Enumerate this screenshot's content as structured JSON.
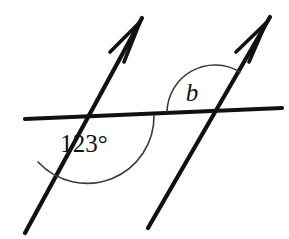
{
  "diagram": {
    "background_color": "#ffffff",
    "stroke_color": "#111111",
    "arc_color": "#3a3a3a",
    "canvas": {
      "width": 289,
      "height": 239
    },
    "labels": {
      "known_angle": "123°",
      "unknown_angle": "b"
    },
    "label_positions": {
      "known_angle": {
        "x": 84,
        "y": 152
      },
      "unknown_angle": {
        "x": 192,
        "y": 101
      }
    },
    "lines": [
      {
        "name": "transversal",
        "role": "horizontal-transversal",
        "x1": 25,
        "y1": 119,
        "x2": 282,
        "y2": 108,
        "arrowhead": false
      },
      {
        "name": "parallel-line-left",
        "role": "parallel-ray-left",
        "x1": 25,
        "y1": 233,
        "x2": 142,
        "y2": 18,
        "arrowhead": true
      },
      {
        "name": "parallel-line-right",
        "role": "parallel-ray-right",
        "x1": 148,
        "y1": 228,
        "x2": 270,
        "y2": 17,
        "arrowhead": true
      }
    ],
    "arrowheads": [
      {
        "name": "arrowhead-left",
        "tip_x": 140,
        "tip_y": 22,
        "barb1_x": 110,
        "barb1_y": 52,
        "barb2_x": 124,
        "barb2_y": 62
      },
      {
        "name": "arrowhead-right",
        "tip_x": 266,
        "tip_y": 23,
        "barb1_x": 236,
        "barb1_y": 52,
        "barb2_x": 249,
        "barb2_y": 62
      }
    ],
    "intersections": [
      {
        "name": "intersection-left",
        "x": 88,
        "y": 118,
        "angle_marked": "123°"
      },
      {
        "name": "intersection-right",
        "x": 215,
        "y": 110,
        "angle_marked": "b"
      }
    ],
    "arcs": [
      {
        "name": "arc-123-degrees",
        "for_label": "123°",
        "center_x": 88,
        "center_y": 118,
        "radius": 67,
        "path": "M 38 162 A 67 67 0 0 0 154 115",
        "position": "below-horizontal-line"
      },
      {
        "name": "arc-b",
        "for_label": "b",
        "center_x": 215,
        "center_y": 110,
        "radius": 48,
        "path": "M 167 112 A 48 48 0 0 1 240 72",
        "position": "above-horizontal-line"
      }
    ]
  }
}
